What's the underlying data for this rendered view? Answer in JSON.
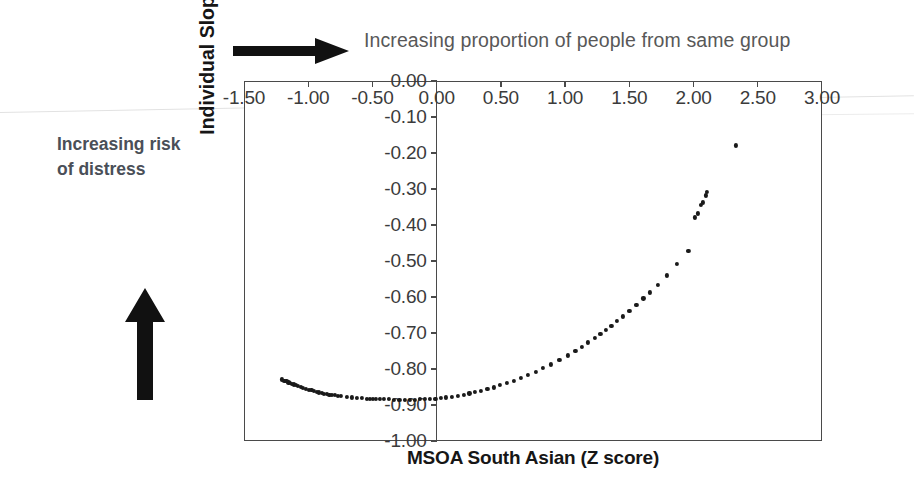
{
  "figure": {
    "annotations": {
      "top_arrow_label": "Increasing proportion of people from same group",
      "left_arrow_label_line1": "Increasing risk",
      "left_arrow_label_line2": "of distress",
      "top_arrow_icon": "right-arrow-icon",
      "left_arrow_icon": "up-arrow-icon"
    },
    "colors": {
      "marker": "#1a1a1a",
      "axis": "#4a4a4a",
      "annotation_top_text": "#585858",
      "annotation_left_text": "#4a4f58",
      "background": "#ffffff"
    }
  },
  "chart_data": {
    "type": "scatter",
    "title": "",
    "xlabel": "MSOA South Asian (Z score)",
    "ylabel": "Individual Slope",
    "xlim": [
      -1.5,
      3.0
    ],
    "ylim": [
      -1.0,
      0.0
    ],
    "grid": false,
    "legend": null,
    "xticks": [
      -1.5,
      -1.0,
      -0.5,
      0.0,
      0.5,
      1.0,
      1.5,
      2.0,
      2.5,
      3.0
    ],
    "xtick_labels": [
      "-1.50",
      "-1.00",
      "-0.50",
      "0.00",
      "0.50",
      "1.00",
      "1.50",
      "2.00",
      "2.50",
      "3.00"
    ],
    "yticks": [
      0.0,
      -0.1,
      -0.2,
      -0.3,
      -0.4,
      -0.5,
      -0.6,
      -0.7,
      -0.8,
      -0.9,
      -1.0
    ],
    "ytick_labels": [
      "0.00",
      "-0.10",
      "-0.20",
      "-0.30",
      "-0.40",
      "-0.50",
      "-0.60",
      "-0.70",
      "-0.80",
      "-0.90",
      "-1.00"
    ],
    "x_axis_position": "top",
    "y_axis_position": "center-at-zero",
    "points": [
      [
        -1.205,
        -0.829
      ],
      [
        -1.185,
        -0.832
      ],
      [
        -1.17,
        -0.834
      ],
      [
        -1.155,
        -0.837
      ],
      [
        -1.14,
        -0.839
      ],
      [
        -1.125,
        -0.841
      ],
      [
        -1.11,
        -0.843
      ],
      [
        -1.095,
        -0.845
      ],
      [
        -1.08,
        -0.847
      ],
      [
        -1.06,
        -0.85
      ],
      [
        -1.04,
        -0.852
      ],
      [
        -1.02,
        -0.855
      ],
      [
        -0.995,
        -0.857
      ],
      [
        -0.975,
        -0.859
      ],
      [
        -0.955,
        -0.861
      ],
      [
        -0.935,
        -0.863
      ],
      [
        -0.915,
        -0.865
      ],
      [
        -0.895,
        -0.867
      ],
      [
        -0.875,
        -0.869
      ],
      [
        -0.855,
        -0.87
      ],
      [
        -0.835,
        -0.871
      ],
      [
        -0.815,
        -0.872
      ],
      [
        -0.795,
        -0.873
      ],
      [
        -0.77,
        -0.874
      ],
      [
        -0.745,
        -0.875
      ],
      [
        -0.7,
        -0.877
      ],
      [
        -0.66,
        -0.879
      ],
      [
        -0.62,
        -0.88
      ],
      [
        -0.58,
        -0.881
      ],
      [
        -0.545,
        -0.882
      ],
      [
        -0.52,
        -0.882
      ],
      [
        -0.495,
        -0.883
      ],
      [
        -0.47,
        -0.883
      ],
      [
        -0.44,
        -0.883
      ],
      [
        -0.41,
        -0.884
      ],
      [
        -0.375,
        -0.884
      ],
      [
        -0.33,
        -0.885
      ],
      [
        -0.29,
        -0.885
      ],
      [
        -0.25,
        -0.885
      ],
      [
        -0.21,
        -0.885
      ],
      [
        -0.17,
        -0.885
      ],
      [
        -0.13,
        -0.884
      ],
      [
        -0.09,
        -0.884
      ],
      [
        -0.05,
        -0.883
      ],
      [
        -0.01,
        -0.882
      ],
      [
        0.03,
        -0.881
      ],
      [
        0.075,
        -0.879
      ],
      [
        0.12,
        -0.877
      ],
      [
        0.165,
        -0.874
      ],
      [
        0.21,
        -0.871
      ],
      [
        0.255,
        -0.868
      ],
      [
        0.3,
        -0.864
      ],
      [
        0.345,
        -0.86
      ],
      [
        0.395,
        -0.856
      ],
      [
        0.445,
        -0.851
      ],
      [
        0.495,
        -0.845
      ],
      [
        0.545,
        -0.839
      ],
      [
        0.6,
        -0.832
      ],
      [
        0.655,
        -0.825
      ],
      [
        0.71,
        -0.817
      ],
      [
        0.77,
        -0.808
      ],
      [
        0.83,
        -0.798
      ],
      [
        0.89,
        -0.787
      ],
      [
        0.955,
        -0.775
      ],
      [
        1.02,
        -0.762
      ],
      [
        1.08,
        -0.749
      ],
      [
        1.13,
        -0.738
      ],
      [
        1.18,
        -0.726
      ],
      [
        1.23,
        -0.714
      ],
      [
        1.275,
        -0.703
      ],
      [
        1.32,
        -0.691
      ],
      [
        1.36,
        -0.68
      ],
      [
        1.405,
        -0.667
      ],
      [
        1.45,
        -0.654
      ],
      [
        1.5,
        -0.639
      ],
      [
        1.555,
        -0.622
      ],
      [
        1.61,
        -0.604
      ],
      [
        1.66,
        -0.587
      ],
      [
        1.72,
        -0.566
      ],
      [
        1.79,
        -0.54
      ],
      [
        1.87,
        -0.509
      ],
      [
        1.96,
        -0.472
      ],
      [
        2.01,
        -0.379
      ],
      [
        2.035,
        -0.368
      ],
      [
        2.06,
        -0.345
      ],
      [
        2.075,
        -0.337
      ],
      [
        2.095,
        -0.318
      ],
      [
        2.105,
        -0.309
      ],
      [
        2.33,
        -0.179
      ]
    ]
  }
}
